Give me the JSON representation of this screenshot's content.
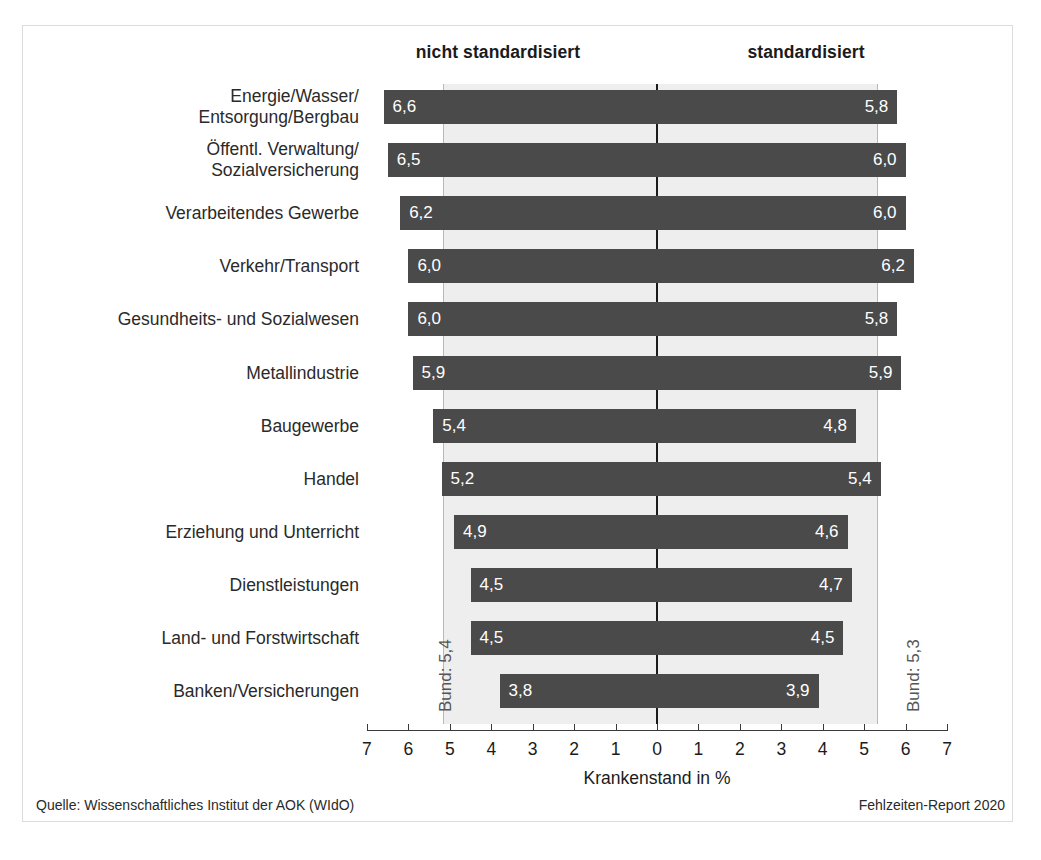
{
  "chart_data": {
    "type": "bar",
    "orientation": "horizontal-diverging",
    "title": "",
    "xlabel": "Krankenstand in %",
    "ylabel": "",
    "grid": false,
    "axis": {
      "tick_labels_left": [
        "7",
        "6",
        "5",
        "4",
        "3",
        "2",
        "1"
      ],
      "center_tick_label": "0",
      "tick_labels_right": [
        "1",
        "2",
        "3",
        "4",
        "5",
        "6",
        "7"
      ],
      "ticks": [
        7,
        6,
        5,
        4,
        3,
        2,
        1,
        0,
        1,
        2,
        3,
        4,
        5,
        6,
        7
      ],
      "min": 0,
      "max": 7,
      "unit": "%"
    },
    "panels": {
      "left_label": "nicht standardisiert",
      "right_label": "standardisiert"
    },
    "reference_lines": [
      {
        "side": "left",
        "label": "Bund: 5,4",
        "value": 5.4
      },
      {
        "side": "right",
        "label": "Bund: 5,3",
        "value": 5.3
      }
    ],
    "categories": [
      "Energie/Wasser/\nEntsorgung/Bergbau",
      "Öffentl. Verwaltung/\nSozialversicherung",
      "Verarbeitendes Gewerbe",
      "Verkehr/Transport",
      "Gesundheits- und Sozialwesen",
      "Metallindustrie",
      "Baugewerbe",
      "Handel",
      "Erziehung und Unterricht",
      "Dienstleistungen",
      "Land- und Forstwirtschaft",
      "Banken/Versicherungen"
    ],
    "series": [
      {
        "name": "nicht standardisiert",
        "values": [
          6.6,
          6.5,
          6.2,
          6.0,
          6.0,
          5.9,
          5.4,
          5.2,
          4.9,
          4.5,
          4.5,
          3.8
        ],
        "labels": [
          "6,6",
          "6,5",
          "6,2",
          "6,0",
          "6,0",
          "5,9",
          "5,4",
          "5,2",
          "4,9",
          "4,5",
          "4,5",
          "3,8"
        ]
      },
      {
        "name": "standardisiert",
        "values": [
          5.8,
          6.0,
          6.0,
          6.2,
          5.8,
          5.9,
          4.8,
          5.4,
          4.6,
          4.7,
          4.5,
          3.9
        ],
        "labels": [
          "5,8",
          "6,0",
          "6,0",
          "6,2",
          "5,8",
          "5,9",
          "4,8",
          "5,4",
          "4,6",
          "4,7",
          "4,5",
          "3,9"
        ]
      }
    ],
    "colors": {
      "bar": "#4a4a4a",
      "band": "#eeeeee",
      "axis": "#1b1b1b",
      "reference_line": "#b9b9b9",
      "bar_value_text": "#ffffff"
    }
  },
  "rows": [
    {
      "label_line1": "Energie/Wasser/",
      "label_line2": "Entsorgung/Bergbau",
      "left": 6.6,
      "left_label": "6,6",
      "right": 5.8,
      "right_label": "5,8"
    },
    {
      "label_line1": "Öffentl. Verwaltung/",
      "label_line2": "Sozialversicherung",
      "left": 6.5,
      "left_label": "6,5",
      "right": 6.0,
      "right_label": "6,0"
    },
    {
      "label_line1": "Verarbeitendes Gewerbe",
      "label_line2": "",
      "left": 6.2,
      "left_label": "6,2",
      "right": 6.0,
      "right_label": "6,0"
    },
    {
      "label_line1": "Verkehr/Transport",
      "label_line2": "",
      "left": 6.0,
      "left_label": "6,0",
      "right": 6.2,
      "right_label": "6,2"
    },
    {
      "label_line1": "Gesundheits- und Sozialwesen",
      "label_line2": "",
      "left": 6.0,
      "left_label": "6,0",
      "right": 5.8,
      "right_label": "5,8"
    },
    {
      "label_line1": "Metallindustrie",
      "label_line2": "",
      "left": 5.9,
      "left_label": "5,9",
      "right": 5.9,
      "right_label": "5,9"
    },
    {
      "label_line1": "Baugewerbe",
      "label_line2": "",
      "left": 5.4,
      "left_label": "5,4",
      "right": 4.8,
      "right_label": "4,8"
    },
    {
      "label_line1": "Handel",
      "label_line2": "",
      "left": 5.2,
      "left_label": "5,2",
      "right": 5.4,
      "right_label": "5,4"
    },
    {
      "label_line1": "Erziehung und Unterricht",
      "label_line2": "",
      "left": 4.9,
      "left_label": "4,9",
      "right": 4.6,
      "right_label": "4,6"
    },
    {
      "label_line1": "Dienstleistungen",
      "label_line2": "",
      "left": 4.5,
      "left_label": "4,5",
      "right": 4.7,
      "right_label": "4,7"
    },
    {
      "label_line1": "Land- und Forstwirtschaft",
      "label_line2": "",
      "left": 4.5,
      "left_label": "4,5",
      "right": 4.5,
      "right_label": "4,5"
    },
    {
      "label_line1": "Banken/Versicherungen",
      "label_line2": "",
      "left": 3.8,
      "left_label": "3,8",
      "right": 3.9,
      "right_label": "3,9"
    }
  ],
  "headers": {
    "left": "nicht standardisiert",
    "right": "standardisiert"
  },
  "bund": {
    "left": "Bund: 5,4",
    "right": "Bund: 5,3",
    "left_value": 5.4,
    "right_value": 5.3
  },
  "axis": {
    "title": "Krankenstand in %",
    "ticks": [
      "7",
      "6",
      "5",
      "4",
      "3",
      "2",
      "1",
      "0",
      "1",
      "2",
      "3",
      "4",
      "5",
      "6",
      "7"
    ]
  },
  "footer": {
    "source": "Quelle: Wissenschaftliches Institut der AOK (WIdO)",
    "report": "Fehlzeiten-Report 2020"
  }
}
